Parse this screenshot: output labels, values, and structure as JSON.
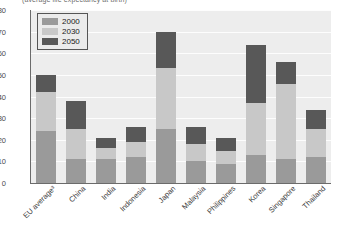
{
  "chart": {
    "subtitle": "(average life expectancy at birth)",
    "note_marker": "3"
  },
  "legend": {
    "position": "top-left",
    "items": [
      {
        "label": "2000",
        "color": "#9a9a9a"
      },
      {
        "label": "2030",
        "color": "#c8c8c8"
      },
      {
        "label": "2050",
        "color": "#585858"
      }
    ]
  },
  "axis": {
    "y_ticks": [
      "80",
      "70",
      "60",
      "50",
      "40",
      "30",
      "20",
      "10",
      "0"
    ]
  },
  "colors": {
    "plot_background": "#ededed",
    "gridline": "#fdfdfd",
    "axis": "#6b6b6b",
    "s2000": "#9a9a9a",
    "s2030": "#c8c8c8",
    "s2050": "#585858"
  },
  "chart_data": {
    "type": "bar",
    "stacked": true,
    "title": "",
    "subtitle": "(average life expectancy at birth)",
    "xlabel": "",
    "ylabel": "",
    "ylim": [
      0,
      80
    ],
    "ytick_step": 10,
    "grid": true,
    "legend_position": "top-left",
    "categories": [
      "EU average³",
      "China",
      "India",
      "Indonesia",
      "Japan",
      "Malaysia",
      "Philippines",
      "Korea",
      "Singapore",
      "Thailand"
    ],
    "series": [
      {
        "name": "2000",
        "color": "#9a9a9a",
        "values": [
          24,
          11,
          11,
          12,
          25,
          10,
          9,
          13,
          11,
          12
        ]
      },
      {
        "name": "2030",
        "color": "#c8c8c8",
        "values": [
          18,
          14,
          5,
          7,
          28,
          8,
          6,
          24,
          35,
          13
        ]
      },
      {
        "name": "2050",
        "color": "#585858",
        "values": [
          8,
          13,
          5,
          7,
          17,
          8,
          6,
          27,
          10,
          9
        ]
      }
    ],
    "totals": [
      50,
      38,
      21,
      26,
      70,
      26,
      21,
      64,
      56,
      34
    ]
  }
}
